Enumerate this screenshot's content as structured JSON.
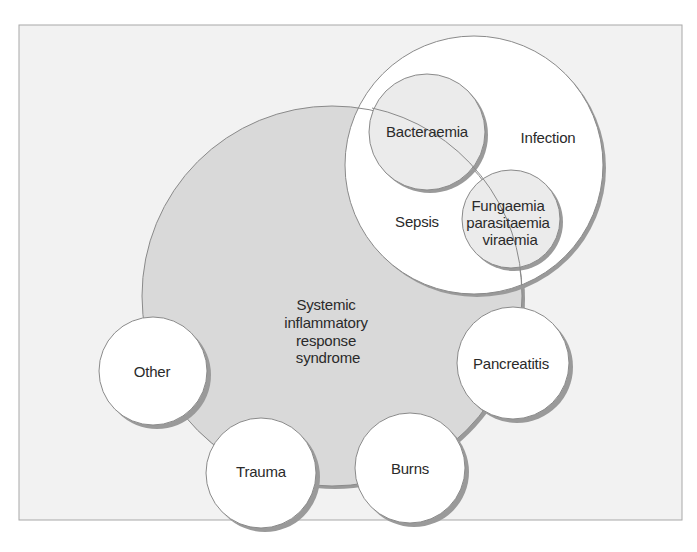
{
  "diagram": {
    "title": "",
    "colors": {
      "background": "#ffffff",
      "panel": "#f2f2f2",
      "panel_border": "#a8a8a8",
      "sirs_fill": "#d9d9d9",
      "circle_fill": "#ffffff",
      "inner_fill": "#ebebeb",
      "stroke": "#8a8a8a",
      "shadow": "#9a9a9a",
      "text": "#2a2a2a"
    },
    "nodes": {
      "sirs": {
        "lines": [
          "Systemic",
          "inflammatory",
          "response",
          "syndrome"
        ]
      },
      "infection": {
        "label": "Infection"
      },
      "sepsis": {
        "label": "Sepsis"
      },
      "bacteraemia": {
        "label": "Bacteraemia"
      },
      "fungaemia": {
        "lines": [
          "Fungaemia",
          "parasitaemia",
          "viraemia"
        ]
      },
      "pancreatitis": {
        "label": "Pancreatitis"
      },
      "burns": {
        "label": "Burns"
      },
      "trauma": {
        "label": "Trauma"
      },
      "other": {
        "label": "Other"
      }
    }
  }
}
